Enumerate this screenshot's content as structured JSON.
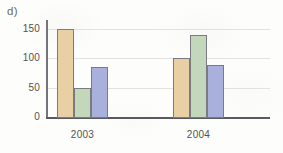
{
  "panel": {
    "label": "d)"
  },
  "chart_data": {
    "type": "bar",
    "title": "",
    "xlabel": "",
    "ylabel": "",
    "categories": [
      "2003",
      "2004"
    ],
    "series": [
      {
        "name": "series-1",
        "color": "#e8cfa4",
        "values": [
          150,
          100
        ]
      },
      {
        "name": "series-2",
        "color": "#c3d8bb",
        "values": [
          50,
          140
        ]
      },
      {
        "name": "series-3",
        "color": "#a9b0db",
        "values": [
          85,
          88
        ]
      }
    ],
    "ylim": [
      0,
      165
    ],
    "yticks": [
      0,
      50,
      100,
      150
    ],
    "ytick_labels": [
      "0",
      "50",
      "100",
      "150"
    ],
    "xtick_labels": [
      "2003",
      "2004"
    ],
    "grid": true,
    "grid_axis": "y",
    "legend": false,
    "bar_outline_color": "#7a7a80",
    "axis_color": "#595960",
    "gridline_color": "#e2e2e0",
    "background": "#fdfdfb"
  }
}
